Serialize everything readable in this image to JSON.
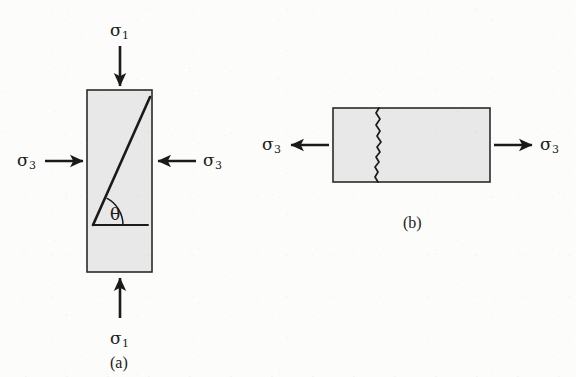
{
  "figure": {
    "background_color": "#fcfcfa",
    "ink_color": "#1a1a1a",
    "specimen_fill": "#e8e8e8",
    "specimen_stroke": "#2a2a2a"
  },
  "panel_a": {
    "caption": "(a)",
    "description": "Vertical specimen under triaxial compression with inclined shear failure plane",
    "axial_stress_top_label": "σ",
    "axial_stress_top_subscript": "1",
    "axial_stress_bottom_label": "σ",
    "axial_stress_bottom_subscript": "1",
    "confining_stress_left_label": "σ",
    "confining_stress_left_subscript": "3",
    "confining_stress_right_label": "σ",
    "confining_stress_right_subscript": "3",
    "angle_label": "θ",
    "axial_arrow_direction": "inward",
    "confining_arrow_direction": "inward",
    "failure_mode": "shear",
    "specimen": {
      "x": 87,
      "y": 90,
      "width": 65,
      "height": 182
    },
    "shear_plane": {
      "x1": 93,
      "y1": 225,
      "x2": 150,
      "y2": 97
    },
    "reference_line": {
      "x1": 93,
      "y1": 225,
      "x2": 148,
      "y2": 225
    },
    "angle_arc_radius": 30
  },
  "panel_b": {
    "caption": "(b)",
    "description": "Horizontal specimen under tension with vertical extension crack",
    "tensile_stress_left_label": "σ",
    "tensile_stress_left_subscript": "3",
    "tensile_stress_right_label": "σ",
    "tensile_stress_right_subscript": "3",
    "arrow_direction": "outward",
    "failure_mode": "tensile-crack",
    "specimen": {
      "x": 333,
      "y": 108,
      "width": 157,
      "height": 74
    },
    "crack_x": 378
  }
}
